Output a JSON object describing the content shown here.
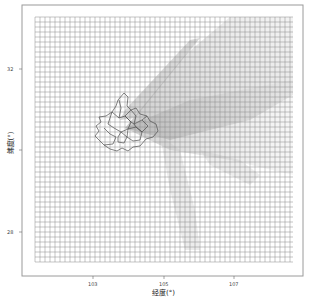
{
  "map": {
    "type": "gridded-domain-map",
    "xlabel": "经度(°)",
    "ylabel": "纬度(°)",
    "x_ticks": [
      {
        "label": "103",
        "px": 93
      },
      {
        "label": "105",
        "px": 164
      },
      {
        "label": "107",
        "px": 234
      }
    ],
    "y_ticks": [
      {
        "label": "32",
        "px": 69
      },
      {
        "label": "30",
        "px": 150
      },
      {
        "label": "28",
        "px": 232
      }
    ],
    "panel": {
      "x": 22,
      "y": 5,
      "w": 281,
      "h": 271
    },
    "grid": {
      "x0": 35,
      "y0": 17,
      "x1": 293,
      "y1": 262,
      "spacing": 5,
      "color": "#8a8a8a"
    },
    "colors": {
      "border": "#9a9a9a",
      "boundary": "#555555",
      "plume": "#bdbdbd"
    }
  },
  "chart_data": {
    "type": "map",
    "title": "",
    "xlabel": "经度(°)",
    "ylabel": "纬度(°)",
    "x_ticks": [
      "103",
      "105",
      "107"
    ],
    "y_ticks": [
      "32",
      "30",
      "28"
    ],
    "xlim": [
      102.5,
      108.0
    ],
    "ylim": [
      27.3,
      33.3
    ],
    "grid": "regular lon-lat mesh, ~0.1° cells",
    "features": [
      "district boundary polygons near 103.8°E, 30.5°N",
      "diffuse grey plume fanning to the northeast and east"
    ]
  }
}
